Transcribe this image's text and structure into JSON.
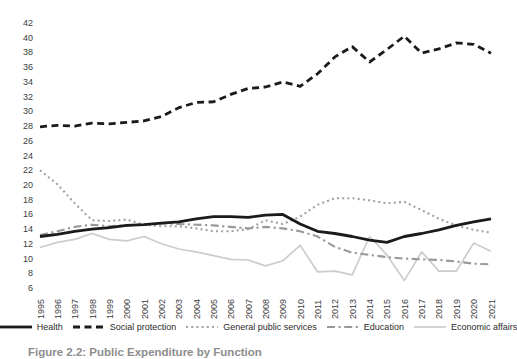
{
  "caption": {
    "text": "Figure 2.2: Public Expenditure by Function"
  },
  "chart_data": {
    "type": "line",
    "title": "",
    "xlabel": "",
    "ylabel": "",
    "x": [
      1995,
      1996,
      1997,
      1998,
      1999,
      2000,
      2001,
      2002,
      2003,
      2004,
      2005,
      2006,
      2007,
      2008,
      2009,
      2010,
      2011,
      2012,
      2013,
      2014,
      2015,
      2016,
      2017,
      2018,
      2019,
      2020,
      2021
    ],
    "ylim": [
      6,
      42
    ],
    "ytick_step": 2,
    "grid": false,
    "legend_position": "bottom",
    "axis_text_color": "#3d3d3d",
    "background_color": "#ffffff",
    "series": [
      {
        "name": "Health",
        "style": "solid",
        "width": 2.8,
        "color": "#1b1b1b",
        "values": [
          13.0,
          13.3,
          13.7,
          14.0,
          14.2,
          14.5,
          14.6,
          14.8,
          15.0,
          15.4,
          15.7,
          15.7,
          15.6,
          15.9,
          16.0,
          14.7,
          13.7,
          13.4,
          13.0,
          12.5,
          12.2,
          13.0,
          13.4,
          13.9,
          14.5,
          15.0,
          15.4
        ]
      },
      {
        "name": "Social protection",
        "style": "dashed",
        "width": 2.8,
        "color": "#1b1b1b",
        "values": [
          27.9,
          28.1,
          28.0,
          28.4,
          28.3,
          28.5,
          28.7,
          29.3,
          30.5,
          31.2,
          31.3,
          32.3,
          33.1,
          33.3,
          34.0,
          33.4,
          35.1,
          37.4,
          38.8,
          36.7,
          38.4,
          40.2,
          37.9,
          38.5,
          39.3,
          39.1,
          37.9
        ]
      },
      {
        "name": "General public services",
        "style": "dotted",
        "width": 2.1,
        "color": "#a1a1a1",
        "values": [
          22.0,
          20.1,
          17.5,
          15.2,
          15.1,
          15.3,
          14.6,
          14.4,
          14.4,
          14.1,
          13.7,
          13.7,
          14.0,
          15.2,
          14.7,
          15.7,
          17.3,
          18.2,
          18.2,
          17.9,
          17.5,
          17.7,
          16.6,
          15.4,
          14.5,
          13.9,
          13.5
        ]
      },
      {
        "name": "Education",
        "style": "dashdot",
        "width": 2.1,
        "color": "#999999",
        "values": [
          13.2,
          13.7,
          14.3,
          14.6,
          14.4,
          14.5,
          14.6,
          14.8,
          14.7,
          14.6,
          14.5,
          14.3,
          14.1,
          14.3,
          14.1,
          13.7,
          13.0,
          11.6,
          10.8,
          10.5,
          10.2,
          10.0,
          9.9,
          9.8,
          9.6,
          9.3,
          9.2
        ]
      },
      {
        "name": "Economic affairs",
        "style": "solid",
        "width": 1.7,
        "color": "#cccccc",
        "values": [
          11.5,
          12.2,
          12.6,
          13.4,
          12.6,
          12.4,
          13.0,
          12.0,
          11.3,
          10.9,
          10.4,
          9.9,
          9.8,
          9.0,
          9.7,
          11.8,
          8.2,
          8.3,
          7.8,
          13.0,
          10.5,
          7.0,
          10.9,
          8.3,
          8.3,
          12.1,
          11.0
        ]
      }
    ]
  }
}
